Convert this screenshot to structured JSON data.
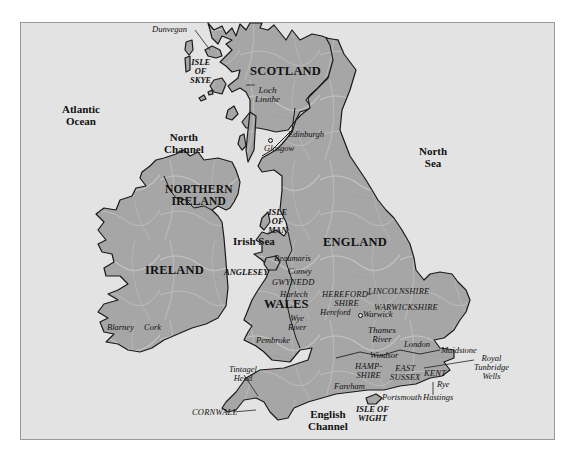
{
  "map": {
    "title": "British Isles",
    "colors": {
      "sea": "#e3e3e3",
      "land": "#a9a9a9",
      "outline": "#1a1a1a",
      "text": "#111111"
    },
    "countries": [
      {
        "label": "SCOTLAND"
      },
      {
        "label": "NORTHERN IRELAND",
        "line1": "NORTHERN",
        "line2": "IRELAND"
      },
      {
        "label": "IRELAND"
      },
      {
        "label": "ENGLAND"
      },
      {
        "label": "WALES"
      }
    ],
    "seas": [
      {
        "label": "Atlantic Ocean",
        "line1": "Atlantic",
        "line2": "Ocean"
      },
      {
        "label": "North Channel",
        "line1": "North",
        "line2": "Channel"
      },
      {
        "label": "North Sea",
        "line1": "North",
        "line2": "Sea"
      },
      {
        "label": "Irish Sea"
      },
      {
        "label": "English Channel",
        "line1": "English",
        "line2": "Channel"
      }
    ],
    "islands": [
      {
        "label": "ISLE OF SKYE",
        "line1": "ISLE",
        "line2": "OF",
        "line3": "SKYE"
      },
      {
        "label": "ISLE OF MAN",
        "line1": "ISLE",
        "line2": "OF",
        "line3": "MAN"
      },
      {
        "label": "ISLE OF WIGHT",
        "line1": "ISLE OF",
        "line2": "WIGHT"
      },
      {
        "label": "ANGLESEY"
      }
    ],
    "regions": [
      {
        "label": "GWYNEDD"
      },
      {
        "label": "LINCOLNSHIRE"
      },
      {
        "label": "HEREFORDSHIRE",
        "line1": "HEREFORD-",
        "line2": "SHIRE"
      },
      {
        "label": "WARWICKSHIRE"
      },
      {
        "label": "HAMPSHIRE",
        "line1": "HAMP-",
        "line2": "SHIRE"
      },
      {
        "label": "EAST SUSSEX",
        "line1": "EAST",
        "line2": "SUSSEX"
      },
      {
        "label": "KENT"
      },
      {
        "label": "CORNWALL"
      }
    ],
    "places": [
      {
        "label": "Dunvegan"
      },
      {
        "label": "Loch Linnhe",
        "line1": "Loch",
        "line2": "Linnhe"
      },
      {
        "label": "Edinburgh"
      },
      {
        "label": "Glasgow"
      },
      {
        "label": "Blarney"
      },
      {
        "label": "Cork"
      },
      {
        "label": "Beaumaris"
      },
      {
        "label": "Conwy"
      },
      {
        "label": "Harlech"
      },
      {
        "label": "Wye River",
        "line1": "Wye",
        "line2": "River"
      },
      {
        "label": "Hereford"
      },
      {
        "label": "Pembroke"
      },
      {
        "label": "Warwick"
      },
      {
        "label": "Thames River",
        "line1": "Thames",
        "line2": "River"
      },
      {
        "label": "London"
      },
      {
        "label": "Windsor"
      },
      {
        "label": "Maidstone"
      },
      {
        "label": "Royal Tunbridge Wells",
        "line1": "Royal",
        "line2": "Tunbridge",
        "line3": "Wells"
      },
      {
        "label": "Rye"
      },
      {
        "label": "Hastings"
      },
      {
        "label": "Fareham"
      },
      {
        "label": "Portsmouth"
      },
      {
        "label": "Tintagel Head",
        "line1": "Tintagel",
        "line2": "Head"
      }
    ]
  }
}
